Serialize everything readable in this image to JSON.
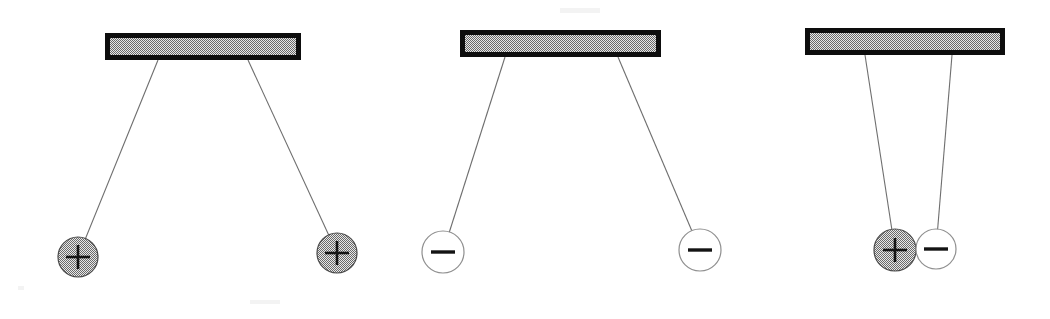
{
  "figure": {
    "background_color": "#ffffff",
    "width": 1050,
    "height": 319
  },
  "style": {
    "bar_fill": "#a8a8a8",
    "bar_stroke": "#0d0d0d",
    "string_color": "#6e6e6e",
    "positive_fill": "#a8a8a8",
    "positive_stroke": "#4a4a4a",
    "negative_fill": "#ffffff",
    "negative_stroke": "#8f8f8f",
    "sign_color": "#131313"
  },
  "panels": [
    {
      "id": "panel-like-positive",
      "label": "two positive charges repelling",
      "interaction": "repulsion",
      "bar": {
        "x": 105,
        "y": 33,
        "width": 196,
        "height": 27
      },
      "spheres": [
        {
          "charge": "+",
          "charge_name": "positive",
          "fill": "gray",
          "cx": 78,
          "cy": 257,
          "r": 20,
          "anchor_x": 158,
          "anchor_y": 60
        },
        {
          "charge": "+",
          "charge_name": "positive",
          "fill": "gray",
          "cx": 337,
          "cy": 253,
          "r": 20,
          "anchor_x": 248,
          "anchor_y": 60
        }
      ]
    },
    {
      "id": "panel-like-negative",
      "label": "two negative charges repelling",
      "interaction": "repulsion",
      "bar": {
        "x": 460,
        "y": 30,
        "width": 201,
        "height": 27
      },
      "spheres": [
        {
          "charge": "−",
          "charge_name": "negative",
          "fill": "white",
          "cx": 443,
          "cy": 252,
          "r": 21,
          "anchor_x": 505,
          "anchor_y": 57
        },
        {
          "charge": "−",
          "charge_name": "negative",
          "fill": "white",
          "cx": 700,
          "cy": 250,
          "r": 21,
          "anchor_x": 618,
          "anchor_y": 57
        }
      ]
    },
    {
      "id": "panel-opposite",
      "label": "positive and negative charges attracting",
      "interaction": "attraction",
      "bar": {
        "x": 805,
        "y": 28,
        "width": 200,
        "height": 27
      },
      "spheres": [
        {
          "charge": "+",
          "charge_name": "positive",
          "fill": "gray",
          "cx": 895,
          "cy": 250,
          "r": 21,
          "anchor_x": 865,
          "anchor_y": 55
        },
        {
          "charge": "−",
          "charge_name": "negative",
          "fill": "white",
          "cx": 936,
          "cy": 249,
          "r": 20,
          "anchor_x": 952,
          "anchor_y": 55
        }
      ]
    }
  ]
}
